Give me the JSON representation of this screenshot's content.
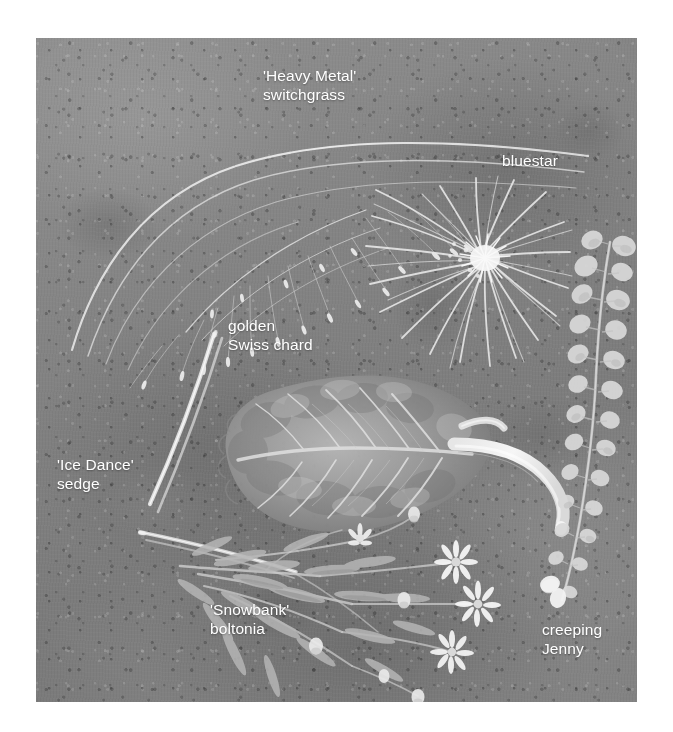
{
  "page": {
    "background_color": "#ffffff",
    "width": 673,
    "height": 732
  },
  "photo": {
    "name": "botanical-specimen-photo",
    "description": "Grayscale overhead photograph of six garden plant cuttings arranged on a mottled concrete slab",
    "background_color": "#878787",
    "frame": {
      "left": 36,
      "top": 38,
      "width": 601,
      "height": 664
    },
    "label_color": "#ffffff"
  },
  "labels": [
    {
      "id": "switchgrass",
      "text": "'Heavy Metal'\nswitchgrass"
    },
    {
      "id": "bluestar",
      "text": "bluestar"
    },
    {
      "id": "chard",
      "text": "golden\nSwiss chard"
    },
    {
      "id": "sedge",
      "text": "'Ice Dance'\nsedge"
    },
    {
      "id": "boltonia",
      "text": "'Snowbank'\nboltonia"
    },
    {
      "id": "creeping",
      "text": "creeping\nJenny"
    }
  ],
  "specimens": [
    {
      "id": "switchgrass",
      "common_name": "'Heavy Metal' switchgrass",
      "position": "upper-left",
      "form": "arcing stems with airy seed panicles"
    },
    {
      "id": "bluestar",
      "common_name": "bluestar",
      "position": "upper-right",
      "form": "radial spray of narrow needle-like leaves"
    },
    {
      "id": "chard",
      "common_name": "golden Swiss chard",
      "position": "center",
      "form": "single crinkled leaf with pale midrib stalk"
    },
    {
      "id": "sedge",
      "common_name": "'Ice Dance' sedge",
      "position": "left",
      "form": "two slender variegated blades"
    },
    {
      "id": "boltonia",
      "common_name": "'Snowbank' boltonia",
      "position": "lower-center",
      "form": "branching stem with narrow leaves and white daisy flowers"
    },
    {
      "id": "creeping",
      "common_name": "creeping Jenny",
      "position": "right",
      "form": "long trailing vine with paired round leaves"
    }
  ]
}
